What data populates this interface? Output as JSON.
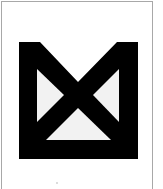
{
  "figure": {
    "type": "logo-mark",
    "colors": {
      "background": "#ffffff",
      "frame": "#a8a8a8",
      "mark": "#000000",
      "inner_triangles": "#f2f2f2"
    },
    "mark_bounds": {
      "left": 19,
      "top": 42,
      "right": 138,
      "bottom": 159
    }
  }
}
